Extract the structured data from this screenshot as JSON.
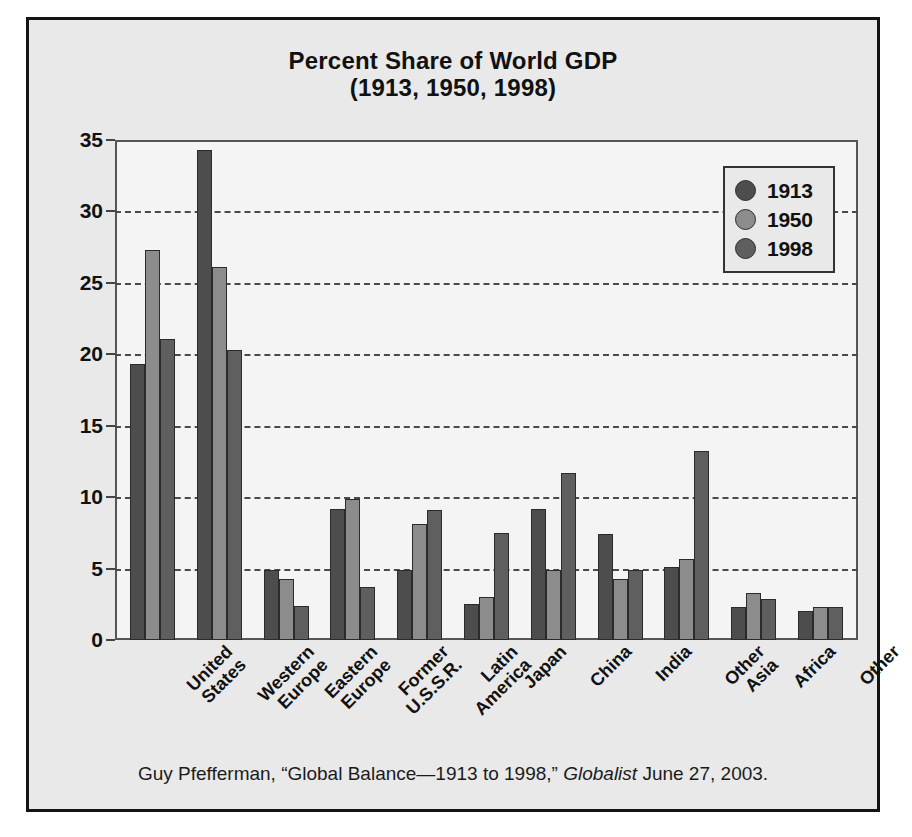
{
  "figure": {
    "title_main": "Percent Share of World GDP",
    "title_sub": "(1913, 1950, 1998)",
    "caption_pre": "Guy Pfefferman, “Global Balance—1913 to 1998,” ",
    "caption_italic": "Globalist",
    "caption_post": " June 27, 2003.",
    "background_color": "#e9e9e9",
    "plot_background_color": "#f4f4f4",
    "border_color": "#141414"
  },
  "legend": {
    "position": "top-right",
    "entries": [
      {
        "label": "1913",
        "color": "#4d4d4d"
      },
      {
        "label": "1950",
        "color": "#8c8c8c"
      },
      {
        "label": "1998",
        "color": "#5f5f5f"
      }
    ]
  },
  "yaxis": {
    "ticks": [
      "0",
      "5",
      "10",
      "15",
      "20",
      "25",
      "30",
      "35"
    ],
    "min": 0,
    "max": 35,
    "step": 5
  },
  "chart_data": {
    "type": "bar",
    "title": "Percent Share of World GDP (1913, 1950, 1998)",
    "xlabel": "",
    "ylabel": "",
    "ylim": [
      0,
      35
    ],
    "ytick_step": 5,
    "grid": true,
    "legend_position": "top-right",
    "categories": [
      "United States",
      "Western Europe",
      "Eastern Europe",
      "Former U.S.S.R.",
      "Latin America",
      "Japan",
      "China",
      "India",
      "Other Asia",
      "Africa",
      "Other"
    ],
    "category_lines": [
      [
        "United",
        "States"
      ],
      [
        "Western",
        "Europe"
      ],
      [
        "Eastern",
        "Europe"
      ],
      [
        "Former",
        "U.S.S.R."
      ],
      [
        "Latin",
        "America"
      ],
      [
        "Japan",
        ""
      ],
      [
        "China",
        ""
      ],
      [
        "India",
        ""
      ],
      [
        "Other",
        "Asia"
      ],
      [
        "Africa",
        ""
      ],
      [
        "Other",
        ""
      ]
    ],
    "series": [
      {
        "name": "1913",
        "color": "#4d4d4d",
        "values": [
          19.3,
          34.3,
          4.9,
          9.2,
          4.9,
          2.5,
          9.2,
          7.4,
          5.1,
          2.3,
          2.0
        ]
      },
      {
        "name": "1950",
        "color": "#8c8c8c",
        "values": [
          27.3,
          26.1,
          4.3,
          9.9,
          8.1,
          3.0,
          4.9,
          4.3,
          5.7,
          3.3,
          2.3
        ]
      },
      {
        "name": "1998",
        "color": "#5f5f5f",
        "values": [
          21.1,
          20.3,
          2.4,
          3.7,
          9.1,
          7.5,
          11.7,
          4.9,
          13.2,
          2.9,
          2.3
        ]
      }
    ]
  }
}
